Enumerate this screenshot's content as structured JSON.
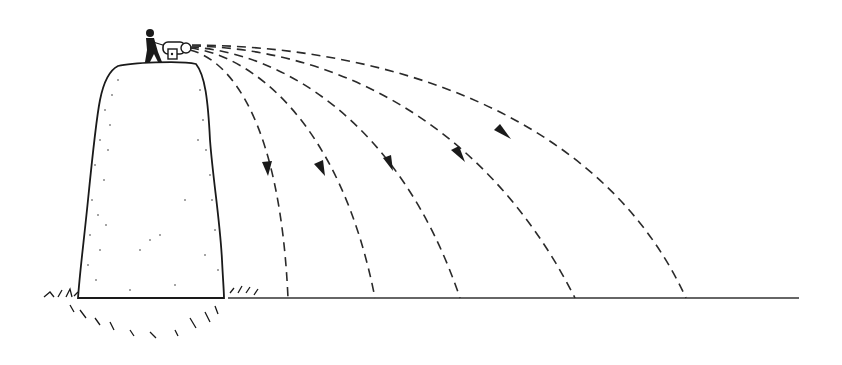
{
  "diagram": {
    "colors": {
      "ink": "#1a1a1a",
      "background": "#ffffff"
    },
    "ground": {
      "y": 298,
      "x_start": 230,
      "x_end": 799
    },
    "cannon": {
      "x": 165,
      "y": 50
    },
    "trajectories": [
      {
        "id": 1,
        "landing_x": 288,
        "arrow_at": [
          267,
          172
        ]
      },
      {
        "id": 2,
        "landing_x": 375,
        "arrow_at": [
          320,
          172
        ]
      },
      {
        "id": 3,
        "landing_x": 460,
        "arrow_at": [
          389,
          166
        ]
      },
      {
        "id": 4,
        "landing_x": 575,
        "arrow_at": [
          458,
          157
        ]
      },
      {
        "id": 5,
        "landing_x": 686,
        "arrow_at": [
          502,
          136
        ]
      }
    ]
  }
}
